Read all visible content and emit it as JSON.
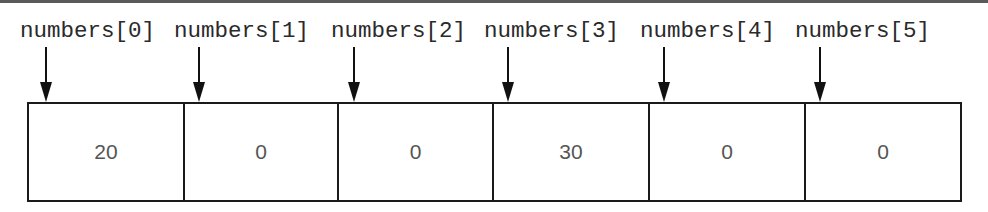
{
  "diagram": {
    "title": "",
    "array_name": "numbers",
    "elements": [
      {
        "index": 0,
        "label": "numbers[0]",
        "value": "20"
      },
      {
        "index": 1,
        "label": "numbers[1]",
        "value": "0"
      },
      {
        "index": 2,
        "label": "numbers[2]",
        "value": "0"
      },
      {
        "index": 3,
        "label": "numbers[3]",
        "value": "30"
      },
      {
        "index": 4,
        "label": "numbers[4]",
        "value": "0"
      },
      {
        "index": 5,
        "label": "numbers[5]",
        "value": "0"
      }
    ],
    "colors": {
      "line": "#1a1a1a",
      "label_text": "#2a2a2a",
      "value_text": "#555555",
      "top_bar": "#5a5a5a"
    }
  }
}
